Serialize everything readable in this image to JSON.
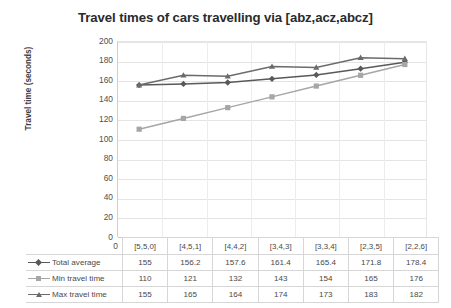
{
  "chart_data": {
    "type": "line",
    "title": "Travel times of cars travelling via [abz,acz,abcz]",
    "xlabel": "",
    "ylabel": "Travel time (seconds)",
    "ylim": [
      0,
      200
    ],
    "ytick_step": 20,
    "yticks": [
      "200",
      "180",
      "160",
      "140",
      "120",
      "100",
      "80",
      "60",
      "40",
      "20",
      "0"
    ],
    "grid": true,
    "legend_position": "data-table-row-headers",
    "categories": [
      "[5,5,0]",
      "[4,5,1]",
      "[4,4,2]",
      "[3,4,3]",
      "[3,3,4]",
      "[2,3,5]",
      "[2,2,6]"
    ],
    "series": [
      {
        "name": "Total average",
        "values": [
          155,
          156.2,
          157.6,
          161.4,
          165.4,
          171.8,
          178.4
        ],
        "display_values": [
          "155",
          "156.2",
          "157.6",
          "161.4",
          "165.4",
          "171.8",
          "178.4"
        ],
        "color": "#595959",
        "marker": "diamond"
      },
      {
        "name": "Min travel time",
        "values": [
          110,
          121,
          132,
          143,
          154,
          165,
          176
        ],
        "display_values": [
          "110",
          "121",
          "132",
          "143",
          "154",
          "165",
          "176"
        ],
        "color": "#a6a6a6",
        "marker": "square"
      },
      {
        "name": "Max travel time",
        "values": [
          155,
          165,
          164,
          174,
          173,
          183,
          182
        ],
        "display_values": [
          "155",
          "165",
          "164",
          "174",
          "173",
          "183",
          "182"
        ],
        "color": "#6b6b6b",
        "marker": "triangle"
      }
    ]
  },
  "colors": {
    "background": "#ffffff",
    "title": "#2b2b2b",
    "gridline": "#e4e4e4",
    "axis": "#c9c9c9",
    "table_border": "#d6d6d6",
    "total_average": "#595959",
    "min_travel_time": "#a6a6a6",
    "max_travel_time": "#6b6b6b"
  }
}
